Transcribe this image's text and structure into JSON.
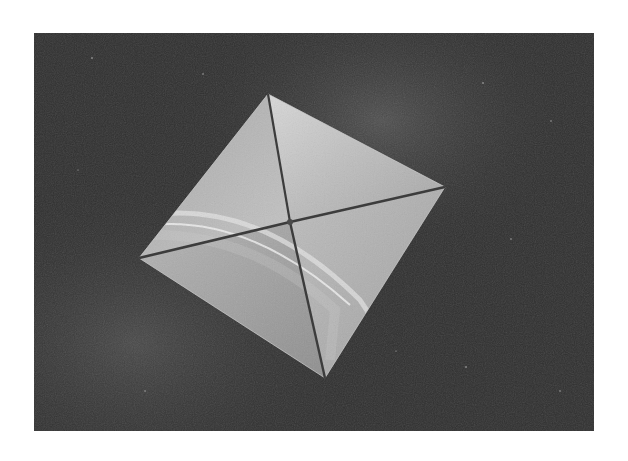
{
  "image": {
    "subject": "solar sail in space",
    "description": "Square four-quadrant reflective solar sail with diagonal booms, floating against a starfield with Milky Way haze; Earth's limb reflected on the sail",
    "colors": {
      "page_background": "#ffffff",
      "space_background": "#2f2f2f",
      "sail_light": "#c9c9c9",
      "sail_mid": "#9a9a9a",
      "boom": "#3a3a3a",
      "haze": "#5a5a5a"
    },
    "frame": {
      "x": 34,
      "y": 33,
      "width": 560,
      "height": 398
    },
    "sail": {
      "top": [
        268,
        94
      ],
      "right": [
        445,
        187
      ],
      "bottom": [
        325,
        378
      ],
      "left": [
        139,
        258
      ],
      "center": [
        290,
        222
      ]
    }
  }
}
